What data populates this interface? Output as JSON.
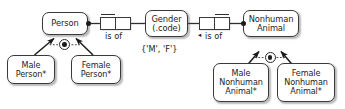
{
  "diagram": {
    "type": "orm-schema",
    "accent_color": "#1d1d1d",
    "stroke_color": "#3a3a3a",
    "background_color": "#ffffff"
  },
  "entities": {
    "person": {
      "label": "Person"
    },
    "gender": {
      "label": "Gender\n(.code)"
    },
    "nonhuman_animal": {
      "label": "Nonhuman\nAnimal"
    },
    "male_person": {
      "label": "Male\nPerson*"
    },
    "female_person": {
      "label": "Female\nPerson*"
    },
    "male_nonhuman_animal": {
      "label": "Male\nNonhuman\nAnimal*"
    },
    "female_nonhuman_animal": {
      "label": "Female\nNonhuman\nAnimal*"
    }
  },
  "predicates": {
    "person_gender": {
      "label": "is of",
      "reading_direction": ""
    },
    "animal_gender": {
      "label": "is of",
      "reading_direction": "◂"
    }
  },
  "constraints": {
    "gender_values": "{'M', 'F'}",
    "person_exclusion": "exclusion-constraint",
    "animal_exclusion": "exclusion-constraint"
  }
}
